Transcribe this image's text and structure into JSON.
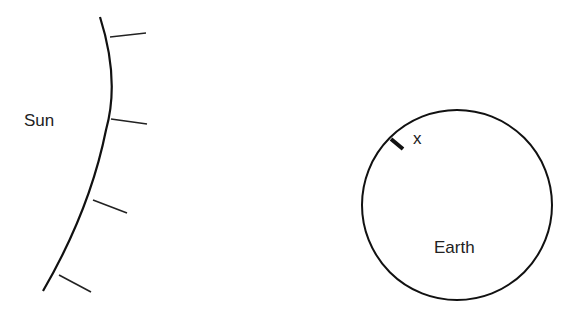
{
  "diagram": {
    "sun_label": "Sun",
    "earth_label": "Earth",
    "point_label": "x",
    "stroke_color": "#111111",
    "rays": 4
  }
}
